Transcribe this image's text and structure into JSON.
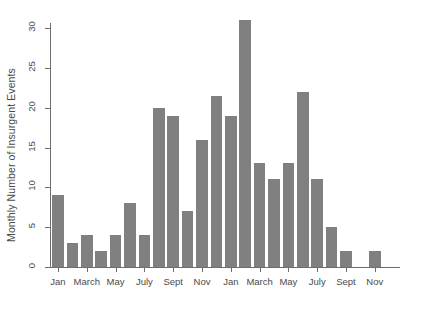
{
  "chart_data": {
    "type": "bar",
    "title": "",
    "xlabel": "",
    "ylabel": "Monthly Number of Insurgent Events",
    "ylim": [
      0,
      32
    ],
    "yticks": [
      0,
      5,
      10,
      15,
      20,
      25,
      30
    ],
    "ytick_labels": [
      "0",
      "5",
      "10",
      "15",
      "20",
      "25",
      "30"
    ],
    "grid": false,
    "legend": null,
    "bar_color": "#808080",
    "axis_color": "#6e6e6e",
    "categories": [
      "Jan",
      "Feb",
      "March",
      "April",
      "May",
      "June",
      "July",
      "Aug",
      "Sept",
      "Oct",
      "Nov",
      "Dec",
      "Jan",
      "Feb",
      "March",
      "April",
      "May",
      "June",
      "July",
      "Aug",
      "Sept",
      "Oct",
      "Nov",
      "Dec"
    ],
    "values": [
      9,
      3,
      4,
      2,
      4,
      8,
      4,
      20,
      19,
      7,
      16,
      21.5,
      19,
      31,
      13,
      11,
      13,
      22,
      11,
      5,
      2,
      0,
      2,
      0
    ],
    "xtick_positions": [
      0,
      2,
      4,
      6,
      8,
      10,
      12,
      14,
      16,
      18,
      20,
      22
    ],
    "xtick_labels": [
      "Jan",
      "March",
      "May",
      "July",
      "Sept",
      "Nov",
      "Jan",
      "March",
      "May",
      "July",
      "Sept",
      "Nov"
    ]
  }
}
